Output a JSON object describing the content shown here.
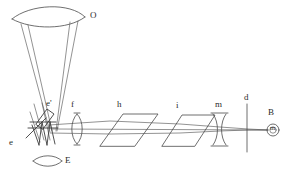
{
  "figure": {
    "background_color": "#ffffff",
    "line_color": "#4a4a4a",
    "label_color": "#2b2b2b",
    "width": 287,
    "height": 176
  },
  "labels": {
    "objective_lens": "O",
    "prism_upper": "e'",
    "prism_lower": "e",
    "eyepiece_lens_lower": "E",
    "lens_f": "f",
    "plate_h": "h",
    "plate_i": "i",
    "lens_m": "m",
    "screen_d": "d",
    "observer_b": "B",
    "observer_symbol": "m"
  },
  "components": [
    {
      "id": "O",
      "name": "objective-lens",
      "type": "biconvex-lens",
      "label": "O"
    },
    {
      "id": "e-prime",
      "name": "upper-prism",
      "type": "tilted-rectangle",
      "label": "e'"
    },
    {
      "id": "e",
      "name": "lower-prism",
      "type": "zigzag-prism",
      "label": "e"
    },
    {
      "id": "E",
      "name": "lower-eyepiece-lens",
      "type": "biconvex-lens",
      "label": "E"
    },
    {
      "id": "f",
      "name": "collimating-lens",
      "type": "biconvex-lens",
      "label": "f"
    },
    {
      "id": "h",
      "name": "polarizer-plate",
      "type": "parallelogram",
      "label": "h"
    },
    {
      "id": "i",
      "name": "analyzer-plate",
      "type": "parallelogram",
      "label": "i"
    },
    {
      "id": "m",
      "name": "biconcave-lens",
      "type": "biconcave-lens",
      "label": "m"
    },
    {
      "id": "d",
      "name": "screen-line",
      "type": "vertical-line",
      "label": "d"
    },
    {
      "id": "B",
      "name": "observer-eye",
      "type": "circled-symbol",
      "label": "B"
    }
  ]
}
